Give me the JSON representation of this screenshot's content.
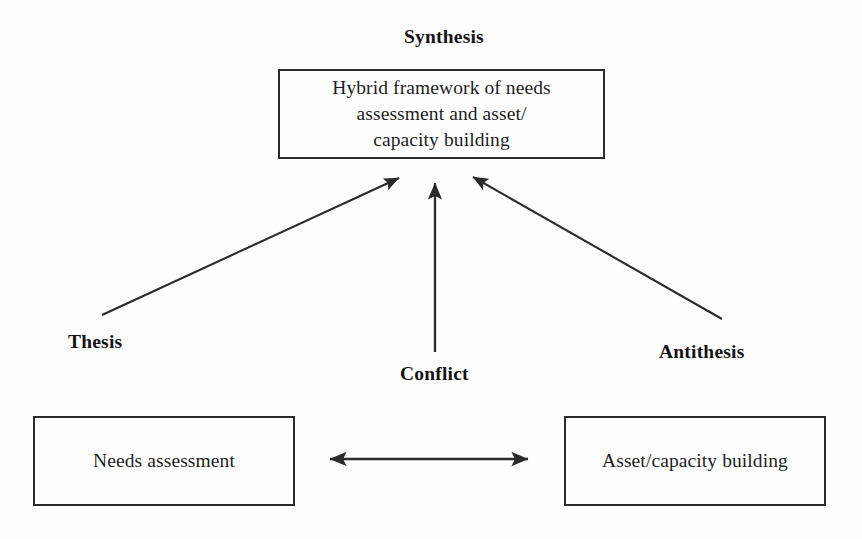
{
  "diagram": {
    "background_color": "#fdfdfd",
    "line_color": "#2b2b2b",
    "text_color": "#1a1a1a"
  },
  "labels": {
    "synthesis": "Synthesis",
    "thesis": "Thesis",
    "conflict": "Conflict",
    "antithesis": "Antithesis"
  },
  "boxes": {
    "synthesis": {
      "text": "Hybrid framework of needs\nassessment and asset/\ncapacity building"
    },
    "thesis": {
      "text": "Needs assessment"
    },
    "antithesis": {
      "text": "Asset/capacity building"
    }
  },
  "connectors": [
    {
      "name": "thesis-to-synthesis-arrow",
      "from": "Thesis",
      "to": "Synthesis",
      "style": "single-headed diagonal arrow pointing up-right"
    },
    {
      "name": "conflict-to-synthesis-arrow",
      "from": "Conflict",
      "to": "Synthesis",
      "style": "single-headed vertical arrow pointing up"
    },
    {
      "name": "antithesis-to-synthesis-arrow",
      "from": "Antithesis",
      "to": "Synthesis",
      "style": "single-headed diagonal arrow pointing up-left"
    },
    {
      "name": "needs-asset-double-arrow",
      "from": "Needs assessment",
      "to": "Asset/capacity building",
      "style": "double-headed horizontal arrow"
    }
  ]
}
